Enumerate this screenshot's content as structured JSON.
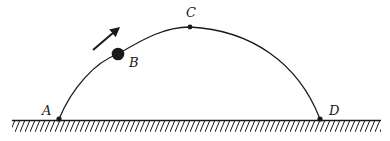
{
  "diagram": {
    "title": "",
    "points": [
      {
        "id": "A",
        "label": "A",
        "x": 59,
        "y": 119,
        "label_x": 42,
        "label_y": 104
      },
      {
        "id": "B",
        "label": "B",
        "x": 118,
        "y": 54,
        "label_x": 129,
        "label_y": 56
      },
      {
        "id": "C",
        "label": "C",
        "x": 190,
        "y": 27,
        "label_x": 186,
        "label_y": 6
      },
      {
        "id": "D",
        "label": "D",
        "x": 320,
        "y": 119,
        "label_x": 328,
        "label_y": 104
      }
    ],
    "ball": {
      "at": "B",
      "radius": 6
    },
    "velocity_arrow": {
      "from": [
        93,
        50
      ],
      "to": [
        121,
        26
      ],
      "direction": "up-right"
    },
    "ground": {
      "y": 120,
      "x_start": 12,
      "x_end": 381,
      "hatch_depth": 11
    },
    "colors": {
      "stroke": "#1a1a1a",
      "background": "#ffffff"
    }
  }
}
